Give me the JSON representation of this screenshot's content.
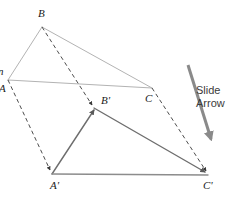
{
  "figure": {
    "canvas": {
      "width": 230,
      "height": 197,
      "background": "#ffffff"
    },
    "colors": {
      "preimage_stroke": "#b3b3b3",
      "image_stroke": "#6e6e6e",
      "dashed_stroke": "#4d4d4d",
      "slide_arrow": "#8a8a8a",
      "label_text": "#1a1a1a",
      "callout_text": "#3b3b3b"
    },
    "preimage": {
      "name": "triangle-abc",
      "stroke": "#b3b3b3",
      "stroke_width": 1,
      "vertices": [
        {
          "id": "A",
          "label": "A",
          "x": 8,
          "y": 80
        },
        {
          "id": "B",
          "label": "B",
          "x": 42,
          "y": 27
        },
        {
          "id": "C",
          "label": "C",
          "x": 152,
          "y": 88
        }
      ]
    },
    "image": {
      "name": "triangle-a-prime-b-prime-c-prime",
      "stroke": "#6e6e6e",
      "stroke_width": 1.5,
      "vertices": [
        {
          "id": "Aprime",
          "label": "A'",
          "x": 52,
          "y": 174
        },
        {
          "id": "Bprime",
          "label": "B'",
          "x": 94,
          "y": 108
        },
        {
          "id": "Cprime",
          "label": "C'",
          "x": 208,
          "y": 175
        }
      ]
    },
    "translation_vectors": [
      {
        "name": "vector-a-to-a-prime",
        "from": "A",
        "to": "A'",
        "x1": 8,
        "y1": 80,
        "x2": 52,
        "y2": 174,
        "style": "dashed",
        "arrowhead": true
      },
      {
        "name": "vector-b-to-b-prime",
        "from": "B",
        "to": "B'",
        "x1": 42,
        "y1": 27,
        "x2": 94,
        "y2": 108,
        "style": "dashed",
        "arrowhead": true
      },
      {
        "name": "vector-c-to-c-prime",
        "from": "C",
        "to": "C'",
        "x1": 152,
        "y1": 88,
        "x2": 208,
        "y2": 175,
        "style": "dashed",
        "arrowhead": true
      }
    ],
    "slide_arrow": {
      "name": "slide-arrow",
      "x1": 188,
      "y1": 65,
      "x2": 213,
      "y2": 144,
      "stroke": "#8a8a8a",
      "stroke_width": 3,
      "arrowhead": true
    }
  },
  "labels": {
    "b": "B",
    "b_prime": "B'",
    "c": "C",
    "c_prime": "C'",
    "a_prime": "A'",
    "a_clipped": "A",
    "clipped_top": "n"
  },
  "callout": {
    "line1": "Slide",
    "line2": "Arrow"
  }
}
